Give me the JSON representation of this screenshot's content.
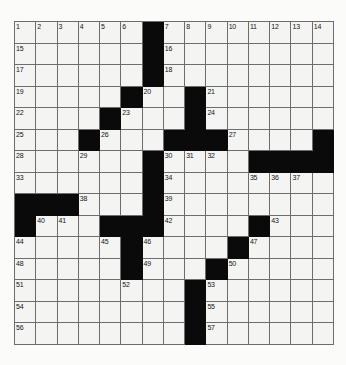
{
  "puzzle": {
    "title": "Crossword Grid",
    "rows": 15,
    "columns": 15,
    "cell_fill_color": "#f4f4f2",
    "block_color": "#0a0a0a",
    "grid_line_color": "#6d6d6d",
    "page_background": "#fbfbfa",
    "number_count": 57,
    "blocks": [
      [
        1,
        7
      ],
      [
        2,
        7
      ],
      [
        3,
        7
      ],
      [
        4,
        6
      ],
      [
        4,
        9
      ],
      [
        5,
        5
      ],
      [
        5,
        9
      ],
      [
        6,
        4
      ],
      [
        6,
        8
      ],
      [
        6,
        9
      ],
      [
        6,
        10
      ],
      [
        6,
        15
      ],
      [
        7,
        7
      ],
      [
        7,
        12
      ],
      [
        7,
        13
      ],
      [
        7,
        14
      ],
      [
        7,
        15
      ],
      [
        8,
        7
      ],
      [
        9,
        1
      ],
      [
        9,
        2
      ],
      [
        9,
        3
      ],
      [
        9,
        7
      ],
      [
        10,
        1
      ],
      [
        10,
        5
      ],
      [
        10,
        6
      ],
      [
        10,
        7
      ],
      [
        10,
        12
      ],
      [
        11,
        6
      ],
      [
        11,
        11
      ],
      [
        12,
        6
      ],
      [
        12,
        10
      ],
      [
        13,
        9
      ],
      [
        14,
        9
      ],
      [
        15,
        9
      ]
    ],
    "numbers": [
      {
        "n": "1",
        "row": 1,
        "col": 1
      },
      {
        "n": "2",
        "row": 1,
        "col": 2
      },
      {
        "n": "3",
        "row": 1,
        "col": 3
      },
      {
        "n": "4",
        "row": 1,
        "col": 4
      },
      {
        "n": "5",
        "row": 1,
        "col": 5
      },
      {
        "n": "6",
        "row": 1,
        "col": 6
      },
      {
        "n": "7",
        "row": 1,
        "col": 8
      },
      {
        "n": "8",
        "row": 1,
        "col": 9
      },
      {
        "n": "9",
        "row": 1,
        "col": 10
      },
      {
        "n": "10",
        "row": 1,
        "col": 11
      },
      {
        "n": "11",
        "row": 1,
        "col": 12
      },
      {
        "n": "12",
        "row": 1,
        "col": 13
      },
      {
        "n": "13",
        "row": 1,
        "col": 14
      },
      {
        "n": "14",
        "row": 1,
        "col": 15
      },
      {
        "n": "15",
        "row": 2,
        "col": 1
      },
      {
        "n": "16",
        "row": 2,
        "col": 8
      },
      {
        "n": "17",
        "row": 3,
        "col": 1
      },
      {
        "n": "18",
        "row": 3,
        "col": 8
      },
      {
        "n": "19",
        "row": 4,
        "col": 1
      },
      {
        "n": "20",
        "row": 4,
        "col": 7
      },
      {
        "n": "21",
        "row": 4,
        "col": 10
      },
      {
        "n": "22",
        "row": 5,
        "col": 1
      },
      {
        "n": "23",
        "row": 5,
        "col": 6
      },
      {
        "n": "24",
        "row": 5,
        "col": 10
      },
      {
        "n": "25",
        "row": 6,
        "col": 1
      },
      {
        "n": "26",
        "row": 6,
        "col": 5
      },
      {
        "n": "27",
        "row": 6,
        "col": 11
      },
      {
        "n": "28",
        "row": 7,
        "col": 1
      },
      {
        "n": "29",
        "row": 7,
        "col": 4
      },
      {
        "n": "30",
        "row": 7,
        "col": 8
      },
      {
        "n": "31",
        "row": 7,
        "col": 9
      },
      {
        "n": "32",
        "row": 7,
        "col": 10
      },
      {
        "n": "33",
        "row": 8,
        "col": 1
      },
      {
        "n": "34",
        "row": 8,
        "col": 8
      },
      {
        "n": "35",
        "row": 8,
        "col": 12
      },
      {
        "n": "36",
        "row": 8,
        "col": 13
      },
      {
        "n": "37",
        "row": 8,
        "col": 14
      },
      {
        "n": "38",
        "row": 9,
        "col": 4
      },
      {
        "n": "39",
        "row": 9,
        "col": 8
      },
      {
        "n": "40",
        "row": 10,
        "col": 2
      },
      {
        "n": "41",
        "row": 10,
        "col": 3
      },
      {
        "n": "42",
        "row": 10,
        "col": 8
      },
      {
        "n": "43",
        "row": 10,
        "col": 13
      },
      {
        "n": "44",
        "row": 11,
        "col": 1
      },
      {
        "n": "45",
        "row": 11,
        "col": 5
      },
      {
        "n": "46",
        "row": 11,
        "col": 7
      },
      {
        "n": "47",
        "row": 11,
        "col": 12
      },
      {
        "n": "48",
        "row": 12,
        "col": 1
      },
      {
        "n": "49",
        "row": 12,
        "col": 7
      },
      {
        "n": "50",
        "row": 12,
        "col": 11
      },
      {
        "n": "51",
        "row": 13,
        "col": 1
      },
      {
        "n": "52",
        "row": 13,
        "col": 6
      },
      {
        "n": "53",
        "row": 13,
        "col": 10
      },
      {
        "n": "54",
        "row": 14,
        "col": 1
      },
      {
        "n": "55",
        "row": 14,
        "col": 10
      },
      {
        "n": "56",
        "row": 15,
        "col": 1
      },
      {
        "n": "57",
        "row": 15,
        "col": 10
      }
    ]
  }
}
